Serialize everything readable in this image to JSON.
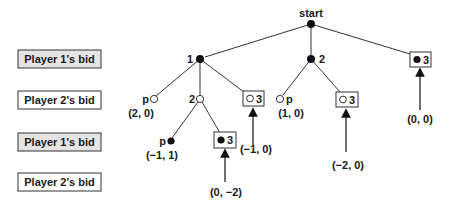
{
  "rows": [
    {
      "label": "Player 1's bid",
      "shaded": true,
      "y": 50
    },
    {
      "label": "Player 2's bid",
      "shaded": false,
      "y": 91
    },
    {
      "label": "Player 1's bid",
      "shaded": true,
      "y": 133
    },
    {
      "label": "Player 2's bid",
      "shaded": false,
      "y": 173
    }
  ],
  "colors": {
    "row_shaded": "#e4e4e4",
    "row_plain": "#ffffff",
    "border": "#333333",
    "ink": "#111111"
  },
  "tree": {
    "root": {
      "label": "start"
    },
    "nodes": {
      "n1": {
        "label": "1"
      },
      "n2": {
        "label": "2"
      },
      "n3_top": {
        "label": "3"
      },
      "p_left": {
        "label": "p",
        "payoff": "(2, 0)"
      },
      "n2_under_1": {
        "label": "2"
      },
      "n3_under_1": {
        "label": "3",
        "payoff": "(−1, 0)"
      },
      "p_under_2": {
        "label": "p",
        "payoff": "(1, 0)"
      },
      "n3_under_2": {
        "label": "3",
        "payoff": "(−2, 0)"
      },
      "p_deep": {
        "label": "p",
        "payoff": "(−1, 1)"
      },
      "n3_deep": {
        "label": "3",
        "payoff": "(0, −2)"
      }
    },
    "top3_payoff": "(0, 0)"
  }
}
